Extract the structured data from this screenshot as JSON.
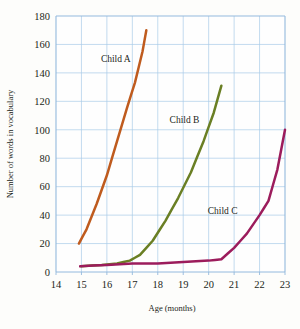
{
  "chart_data": {
    "type": "line",
    "title": "",
    "xlabel": "Age (months)",
    "ylabel": "Number of words in vocabulary",
    "xlim": [
      14,
      23
    ],
    "ylim": [
      0,
      180
    ],
    "xticks": [
      14,
      15,
      16,
      17,
      18,
      19,
      20,
      21,
      22,
      23
    ],
    "yticks": [
      0,
      20,
      40,
      60,
      80,
      100,
      120,
      140,
      160,
      180
    ],
    "grid": true,
    "legend_position": "inline-labels",
    "series": [
      {
        "name": "Child A",
        "color": "#bf5b1e",
        "label_x": 16.35,
        "label_y": 148,
        "x": [
          14.9,
          15.2,
          15.6,
          16.0,
          16.4,
          16.8,
          17.1,
          17.4,
          17.55
        ],
        "y": [
          20,
          30,
          48,
          68,
          92,
          116,
          133,
          155,
          170
        ]
      },
      {
        "name": "Child B",
        "color": "#6a7f24",
        "label_x": 19.05,
        "label_y": 105,
        "x": [
          15.0,
          15.8,
          16.4,
          16.9,
          17.3,
          17.8,
          18.3,
          18.8,
          19.3,
          19.8,
          20.2,
          20.5
        ],
        "y": [
          4,
          5,
          6,
          8,
          12,
          22,
          36,
          52,
          70,
          92,
          112,
          131
        ]
      },
      {
        "name": "Child C",
        "color": "#9c1c5c",
        "label_x": 20.55,
        "label_y": 41,
        "x": [
          14.95,
          16.0,
          17.0,
          18.0,
          19.0,
          20.0,
          20.5,
          21.0,
          21.5,
          22.0,
          22.35,
          22.7,
          23.0
        ],
        "y": [
          4,
          5,
          6,
          6,
          7,
          8,
          9,
          17,
          27,
          40,
          50,
          72,
          100
        ]
      }
    ]
  }
}
